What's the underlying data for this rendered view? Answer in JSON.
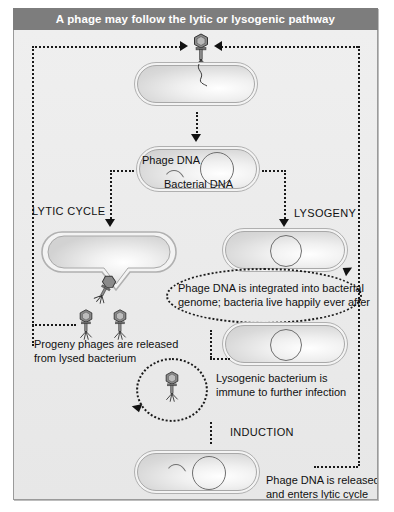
{
  "title": "A phage may follow the lytic or lysogenic pathway",
  "colors": {
    "title_bar": "#7d7d7d",
    "title_text": "#ffffff",
    "canvas": "#ebebeb",
    "frame_border": "#9a9a9a",
    "ink": "#111111",
    "cell_outline": "#a8a8a8",
    "dna_outline": "#6f6f6f"
  },
  "labels": {
    "phage_dna": "Phage DNA",
    "bacterial_dna": "Bacterial DNA",
    "lytic_cycle": "LYTIC CYCLE",
    "lysogeny": "LYSOGENY",
    "induction": "INDUCTION"
  },
  "captions": {
    "progeny": "Progeny phages are released\nfrom lysed bacterium",
    "integrated": "Phage DNA is integrated into bacterial\ngenome; bacteria live happily ever after",
    "immune": "Lysogenic bacterium is\nimmune to further infection",
    "released": "Phage DNA is released\nand enters lytic cycle"
  },
  "icons": {
    "phage": "bacteriophage-icon",
    "bacterium": "bacterium-capsule-icon",
    "lysed_bacterium": "lysed-bacterium-icon",
    "dna_loop": "dna-circle-icon",
    "dna_arc": "phage-dna-arc-icon",
    "cycle_arrow": "circular-arrow-icon"
  }
}
